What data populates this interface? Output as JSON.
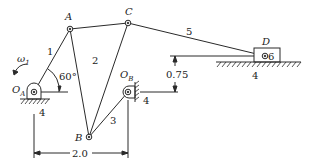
{
  "diagram": {
    "type": "linkage-mechanism",
    "points": {
      "A": "A",
      "B": "B",
      "C": "C",
      "D": "D",
      "OA": "O",
      "OA_sub": "A",
      "OB": "O",
      "OB_sub": "B"
    },
    "links": {
      "l1": "1",
      "l2": "2",
      "l3": "3",
      "l5": "5",
      "l6": "6"
    },
    "ground_labels": {
      "g_oa": "4",
      "g_ob": "4",
      "g_d": "4"
    },
    "angular_velocity": {
      "symbol": "ω",
      "sub": "1"
    },
    "angle_label": "60°",
    "dimensions": {
      "horizontal": "2.0",
      "vertical": "0.75"
    },
    "colors": {
      "line": "#2a2a2a",
      "background": "#ffffff"
    }
  }
}
